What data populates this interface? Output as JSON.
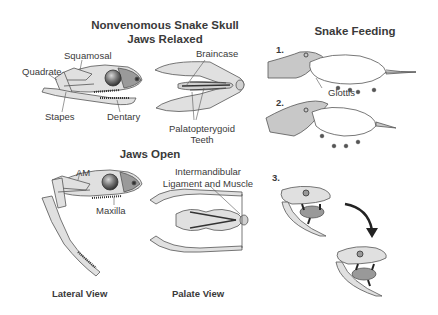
{
  "skull": {
    "title_line1": "Nonvenomous Snake Skull",
    "title_line2": "Jaws Relaxed",
    "relaxed_lateral_labels": {
      "squamosal": "Squamosal",
      "quadrate": "Quadrate",
      "stapes": "Stapes",
      "dentary": "Dentary"
    },
    "relaxed_palate_labels": {
      "braincase": "Braincase",
      "palatopterygoid_line1": "Palatopterygoid",
      "palatopterygoid_line2": "Teeth"
    },
    "open_title": "Jaws Open",
    "open_lateral_labels": {
      "am": "AM",
      "maxilla": "Maxilla"
    },
    "open_palate_labels": {
      "intermandibular_line1": "Intermandibular",
      "intermandibular_line2": "Ligament and Muscle"
    },
    "captions": {
      "lateral": "Lateral View",
      "palate": "Palate View"
    }
  },
  "feeding": {
    "title": "Snake Feeding",
    "steps": [
      "1.",
      "2.",
      "3."
    ],
    "glottis_label": "Glottis"
  },
  "colors": {
    "bone_fill": "#e0e0e0",
    "snake_fill": "#c8c8c8",
    "outline": "#555555",
    "text": "#3a3a3a"
  }
}
